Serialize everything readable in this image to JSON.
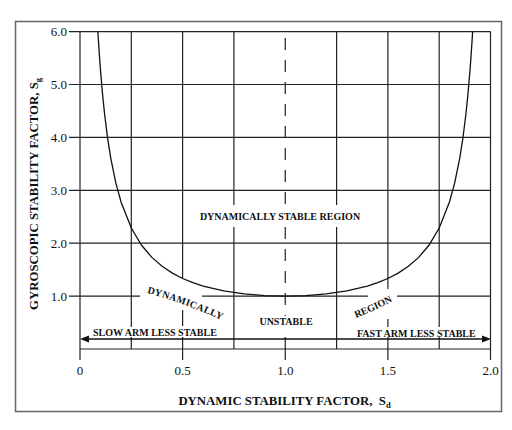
{
  "chart_data": {
    "type": "line",
    "title": "",
    "xlabel": "DYNAMIC STABILITY FACTOR, Sd",
    "ylabel": "GYROSCOPIC STABILITY FACTOR, Sg",
    "xlabel_parts": {
      "main": "DYNAMIC STABILITY FACTOR,  S",
      "sub": "d"
    },
    "ylabel_parts": {
      "main": "GYROSCOPIC STABILITY FACTOR, S",
      "sub": "g"
    },
    "xlim": [
      0,
      2.0
    ],
    "ylim": [
      0,
      6.0
    ],
    "grid": true,
    "legend": null,
    "x_ticks": [
      0,
      0.5,
      1.0,
      1.5,
      2.0
    ],
    "x_tick_labels": [
      "0",
      "0.5",
      "1.0",
      "1.5",
      "2.0"
    ],
    "y_ticks": [
      1.0,
      2.0,
      3.0,
      4.0,
      5.0,
      6.0
    ],
    "y_tick_labels": [
      "1.0",
      "2.0",
      "3.0",
      "4.0",
      "5.0",
      "6.0"
    ],
    "series": [
      {
        "style": "solid",
        "x": [
          0.087,
          0.09,
          0.095,
          0.1,
          0.11,
          0.12,
          0.135,
          0.15,
          0.175,
          0.2,
          0.25,
          0.3,
          0.35,
          0.4,
          0.45,
          0.5,
          0.55,
          0.6,
          0.7,
          0.8,
          0.9,
          1.0,
          1.1,
          1.2,
          1.3,
          1.4,
          1.45,
          1.5,
          1.55,
          1.6,
          1.65,
          1.7,
          1.75,
          1.8,
          1.825,
          1.85,
          1.865,
          1.88,
          1.89,
          1.9,
          1.905,
          1.91,
          1.913
        ],
        "y": [
          6.0,
          5.817,
          5.526,
          5.263,
          4.81,
          4.433,
          3.972,
          3.604,
          3.131,
          2.778,
          2.286,
          1.961,
          1.732,
          1.563,
          1.434,
          1.333,
          1.254,
          1.19,
          1.099,
          1.042,
          1.01,
          1.0,
          1.01,
          1.042,
          1.099,
          1.19,
          1.254,
          1.333,
          1.434,
          1.563,
          1.732,
          1.961,
          2.286,
          2.778,
          3.131,
          3.604,
          3.972,
          4.433,
          4.81,
          5.263,
          5.526,
          5.817,
          6.0
        ]
      }
    ],
    "reference_lines": [
      {
        "orientation": "vertical",
        "x": 1.0,
        "style": "dashed"
      }
    ],
    "annotations": [
      {
        "text": "DYNAMICALLY STABLE REGION",
        "x": 0.97,
        "y": 2.5
      },
      {
        "text": "DYNAMICALLY",
        "x": 0.51,
        "y": 0.85,
        "rotation": 20
      },
      {
        "text": "UNSTABLE",
        "x": 1.0,
        "y": 0.5
      },
      {
        "text": "REGION",
        "x": 1.44,
        "y": 0.75,
        "rotation": -22
      },
      {
        "text": "SLOW ARM LESS STABLE",
        "arrow": "left",
        "y": 0.2
      },
      {
        "text": "FAST ARM LESS STABLE",
        "arrow": "right",
        "y": 0.2
      }
    ]
  }
}
